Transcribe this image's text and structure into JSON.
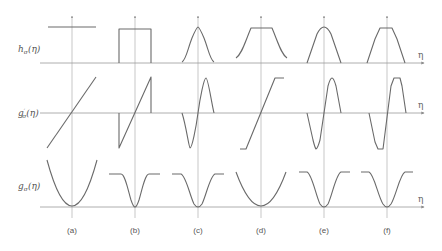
{
  "rows": [
    {
      "label": "h_σ(η)",
      "label_main": "h",
      "label_sub": "σ",
      "label_arg": "(η)",
      "axis_label": "η"
    },
    {
      "label": "g'_σ(η)",
      "label_main": "g",
      "label_sup": "′",
      "label_sub": "σ",
      "label_arg": "(η)",
      "axis_label": "η"
    },
    {
      "label": "g_σ(η)",
      "label_main": "g",
      "label_sub": "σ",
      "label_arg": "(η)",
      "axis_label": "η"
    }
  ],
  "columns": [
    {
      "label": "(a)",
      "h_shape": "constant",
      "gprime_shape": "linear",
      "g_shape": "parabola"
    },
    {
      "label": "(b)",
      "h_shape": "rectangle",
      "gprime_shape": "sawtooth-linear",
      "g_shape": "truncated-parabola"
    },
    {
      "label": "(c)",
      "h_shape": "gaussian-bell",
      "gprime_shape": "derivative-of-gaussian",
      "g_shape": "smooth-well"
    },
    {
      "label": "(d)",
      "h_shape": "flat-top-with-tails",
      "gprime_shape": "saturating-linear",
      "g_shape": "parabola-wide"
    },
    {
      "label": "(e)",
      "h_shape": "triangular-bell",
      "gprime_shape": "odd-bump",
      "g_shape": "smooth-well"
    },
    {
      "label": "(f)",
      "h_shape": "trapezoid",
      "gprime_shape": "odd-trapezoid",
      "g_shape": "smooth-well"
    }
  ],
  "colors": {
    "curve": "#6a6a6a",
    "axis": "#9a9a9a"
  }
}
